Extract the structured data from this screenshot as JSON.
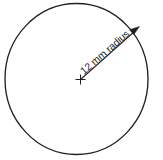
{
  "diagram": {
    "background_color": "#ffffff",
    "stroke_color": "#231f20",
    "shape": {
      "name": "circle",
      "center_x": 80,
      "center_y": 79,
      "radius_px": 72,
      "fill_color": "#ffffff"
    },
    "center_marker": {
      "glyph": "plus-cross",
      "x": 80,
      "y": 79,
      "arm_length_px": 5
    },
    "radius_annotation": {
      "label": "12 mm radius",
      "value": "12",
      "unit": "mm",
      "measure": "radius",
      "angle_deg": -41,
      "from_x": 80,
      "from_y": 79,
      "to_x": 138,
      "to_y": 28,
      "arrow": "single-ended-arrow-at-circumference"
    }
  }
}
